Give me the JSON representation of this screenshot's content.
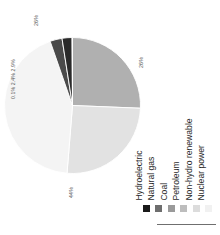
{
  "chart_data": {
    "type": "pie",
    "title": "",
    "subtitle": "",
    "xlabel": "",
    "ylabel": "",
    "grid": false,
    "orientation": "rotated-90-ccw",
    "legend_position": "right",
    "start_angle_deg": 0,
    "direction": "clockwise",
    "categories": [
      "Hydroelectric",
      "Natural gas",
      "Coal",
      "Petroleum",
      "Non-hydro renewable",
      "Nuclear power"
    ],
    "values": [
      2.4,
      26,
      44,
      0.1,
      2.9,
      26
    ],
    "value_unit": "%",
    "colors": [
      "#1a1a1a",
      "#6e6e6e",
      "#9a9a9a",
      "#b9b9b9",
      "#d8d8d8",
      "#f2f2f2"
    ],
    "slices": [
      {
        "label": "Natural gas",
        "value": 26,
        "display": "26%",
        "color": "#b0b0b0"
      },
      {
        "label": "Nuclear power",
        "value": 26,
        "display": "26%",
        "color": "#e2e2e2"
      },
      {
        "label": "Coal",
        "value": 44,
        "display": "44%",
        "color": "#f4f4f4"
      },
      {
        "label": "Non-hydro renewable",
        "value": 2.9,
        "display": "2.9%",
        "color": "#4a4a4a"
      },
      {
        "label": "Hydroelectric",
        "value": 2.4,
        "display": "2.4%",
        "color": "#2a2a2a"
      },
      {
        "label": "Petroleum",
        "value": 0.1,
        "display": "0.1%",
        "color": "#8a8a8a"
      }
    ],
    "annotations": {
      "natural_gas_pct": "26%",
      "nuclear_pct": "26%",
      "coal_pct": "44%",
      "small_slices_pct": "0.1% 2.4% 2.9%"
    }
  },
  "legend": {
    "items": [
      {
        "label": "Hydroelectric",
        "color": "#1a1a1a"
      },
      {
        "label": "Natural gas",
        "color": "#6e6e6e"
      },
      {
        "label": "Coal",
        "color": "#9a9a9a"
      },
      {
        "label": "Petroleum",
        "color": "#bdbdbd"
      },
      {
        "label": "Non-hydro renewable",
        "color": "#dcdcdc"
      },
      {
        "label": "Nuclear power",
        "color": "#f1f1f1"
      }
    ]
  }
}
